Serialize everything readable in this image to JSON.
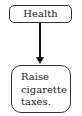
{
  "diagram": {
    "type": "flowchart",
    "nodes": [
      {
        "id": "health",
        "label": "Health"
      },
      {
        "id": "action",
        "lines": [
          "Raise",
          "cigarette",
          "taxes."
        ]
      }
    ],
    "edges": [
      {
        "from": "health",
        "to": "action",
        "style": "arrow"
      }
    ]
  }
}
